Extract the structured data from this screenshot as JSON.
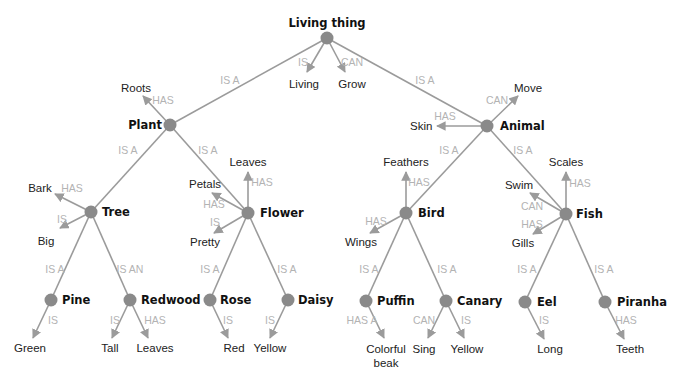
{
  "diagram": {
    "type": "semantic-network",
    "colors": {
      "edge": "#9b9b9b",
      "node": "#8a8a8a",
      "relation_text": "#b3b3b3",
      "node_text": "#111111",
      "leaf_text": "#222222"
    },
    "nodes": [
      {
        "id": "living_thing",
        "label": "Living thing",
        "x": 327,
        "y": 38,
        "label_x": 327,
        "label_y": 27,
        "anchor": "middle"
      },
      {
        "id": "plant",
        "label": "Plant",
        "x": 170,
        "y": 125,
        "label_x": 162,
        "label_y": 129,
        "anchor": "end"
      },
      {
        "id": "animal",
        "label": "Animal",
        "x": 487,
        "y": 126,
        "label_x": 500,
        "label_y": 130,
        "anchor": "start"
      },
      {
        "id": "tree",
        "label": "Tree",
        "x": 91,
        "y": 212,
        "label_x": 102,
        "label_y": 216,
        "anchor": "start"
      },
      {
        "id": "flower",
        "label": "Flower",
        "x": 248,
        "y": 213,
        "label_x": 260,
        "label_y": 217,
        "anchor": "start"
      },
      {
        "id": "bird",
        "label": "Bird",
        "x": 406,
        "y": 213,
        "label_x": 418,
        "label_y": 217,
        "anchor": "start"
      },
      {
        "id": "fish",
        "label": "Fish",
        "x": 566,
        "y": 214,
        "label_x": 576,
        "label_y": 218,
        "anchor": "start"
      },
      {
        "id": "pine",
        "label": "Pine",
        "x": 51,
        "y": 300,
        "label_x": 62,
        "label_y": 304,
        "anchor": "start"
      },
      {
        "id": "redwood",
        "label": "Redwood",
        "x": 130,
        "y": 300,
        "label_x": 141,
        "label_y": 304,
        "anchor": "start"
      },
      {
        "id": "rose",
        "label": "Rose",
        "x": 210,
        "y": 300,
        "label_x": 220,
        "label_y": 304,
        "anchor": "start"
      },
      {
        "id": "daisy",
        "label": "Daisy",
        "x": 288,
        "y": 300,
        "label_x": 298,
        "label_y": 304,
        "anchor": "start"
      },
      {
        "id": "puffin",
        "label": "Puffin",
        "x": 366,
        "y": 301,
        "label_x": 377,
        "label_y": 305,
        "anchor": "start"
      },
      {
        "id": "canary",
        "label": "Canary",
        "x": 446,
        "y": 301,
        "label_x": 457,
        "label_y": 305,
        "anchor": "start"
      },
      {
        "id": "eel",
        "label": "Eel",
        "x": 525,
        "y": 302,
        "label_x": 537,
        "label_y": 306,
        "anchor": "start"
      },
      {
        "id": "piranha",
        "label": "Piranha",
        "x": 605,
        "y": 302,
        "label_x": 617,
        "label_y": 306,
        "anchor": "start"
      }
    ],
    "edges": [
      {
        "from": "living_thing",
        "to": "plant",
        "relation": "IS A",
        "x1": 327,
        "y1": 38,
        "x2": 170,
        "y2": 125,
        "arrow": false,
        "rel_x": 230,
        "rel_y": 84
      },
      {
        "from": "living_thing",
        "to": "animal",
        "relation": "IS A",
        "x1": 327,
        "y1": 38,
        "x2": 487,
        "y2": 126,
        "arrow": false,
        "rel_x": 425,
        "rel_y": 84
      },
      {
        "from": "plant",
        "to": "tree",
        "relation": "IS A",
        "x1": 170,
        "y1": 125,
        "x2": 91,
        "y2": 212,
        "arrow": false,
        "rel_x": 128,
        "rel_y": 154
      },
      {
        "from": "plant",
        "to": "flower",
        "relation": "IS A",
        "x1": 170,
        "y1": 125,
        "x2": 248,
        "y2": 213,
        "arrow": false,
        "rel_x": 208,
        "rel_y": 154
      },
      {
        "from": "animal",
        "to": "bird",
        "relation": "IS A",
        "x1": 487,
        "y1": 126,
        "x2": 406,
        "y2": 213,
        "arrow": false,
        "rel_x": 449,
        "rel_y": 154
      },
      {
        "from": "animal",
        "to": "fish",
        "relation": "IS A",
        "x1": 487,
        "y1": 126,
        "x2": 566,
        "y2": 214,
        "arrow": false,
        "rel_x": 523,
        "rel_y": 154
      },
      {
        "from": "tree",
        "to": "pine",
        "relation": "IS A",
        "x1": 91,
        "y1": 212,
        "x2": 51,
        "y2": 300,
        "arrow": false,
        "rel_x": 55,
        "rel_y": 273
      },
      {
        "from": "tree",
        "to": "redwood",
        "relation": "IS AN",
        "x1": 91,
        "y1": 212,
        "x2": 130,
        "y2": 300,
        "arrow": false,
        "rel_x": 130,
        "rel_y": 273
      },
      {
        "from": "flower",
        "to": "rose",
        "relation": "IS A",
        "x1": 248,
        "y1": 213,
        "x2": 210,
        "y2": 300,
        "arrow": false,
        "rel_x": 210,
        "rel_y": 273
      },
      {
        "from": "flower",
        "to": "daisy",
        "relation": "IS A",
        "x1": 248,
        "y1": 213,
        "x2": 288,
        "y2": 300,
        "arrow": false,
        "rel_x": 287,
        "rel_y": 273
      },
      {
        "from": "bird",
        "to": "puffin",
        "relation": "IS A",
        "x1": 406,
        "y1": 213,
        "x2": 366,
        "y2": 301,
        "arrow": false,
        "rel_x": 369,
        "rel_y": 273
      },
      {
        "from": "bird",
        "to": "canary",
        "relation": "IS A",
        "x1": 406,
        "y1": 213,
        "x2": 446,
        "y2": 301,
        "arrow": false,
        "rel_x": 447,
        "rel_y": 273
      },
      {
        "from": "fish",
        "to": "eel",
        "relation": "IS A",
        "x1": 566,
        "y1": 214,
        "x2": 525,
        "y2": 302,
        "arrow": false,
        "rel_x": 527,
        "rel_y": 273
      },
      {
        "from": "fish",
        "to": "piranha",
        "relation": "IS A",
        "x1": 566,
        "y1": 214,
        "x2": 605,
        "y2": 302,
        "arrow": false,
        "rel_x": 604,
        "rel_y": 273
      },
      {
        "from": "living_thing",
        "to": "living",
        "relation": "IS",
        "x1": 327,
        "y1": 38,
        "x2": 307,
        "y2": 72,
        "arrow": true,
        "rel_x": 303,
        "rel_y": 66
      },
      {
        "from": "living_thing",
        "to": "grow",
        "relation": "CAN",
        "x1": 327,
        "y1": 38,
        "x2": 345,
        "y2": 72,
        "arrow": true,
        "rel_x": 352,
        "rel_y": 66
      },
      {
        "from": "plant",
        "to": "roots",
        "relation": "HAS",
        "x1": 170,
        "y1": 125,
        "x2": 143,
        "y2": 96,
        "arrow": true,
        "rel_x": 163,
        "rel_y": 104
      },
      {
        "from": "animal",
        "to": "move",
        "relation": "CAN",
        "x1": 487,
        "y1": 126,
        "x2": 518,
        "y2": 96,
        "arrow": true,
        "rel_x": 497,
        "rel_y": 104
      },
      {
        "from": "animal",
        "to": "skin",
        "relation": "HAS",
        "x1": 487,
        "y1": 126,
        "x2": 437,
        "y2": 126,
        "arrow": true,
        "rel_x": 445,
        "rel_y": 120
      },
      {
        "from": "tree",
        "to": "bark",
        "relation": "HAS",
        "x1": 91,
        "y1": 212,
        "x2": 55,
        "y2": 194,
        "arrow": true,
        "rel_x": 72,
        "rel_y": 192
      },
      {
        "from": "tree",
        "to": "big",
        "relation": "IS",
        "x1": 91,
        "y1": 212,
        "x2": 60,
        "y2": 228,
        "arrow": true,
        "rel_x": 62,
        "rel_y": 223
      },
      {
        "from": "flower",
        "to": "leaves",
        "relation": "HAS",
        "x1": 248,
        "y1": 213,
        "x2": 248,
        "y2": 172,
        "arrow": true,
        "rel_x": 262,
        "rel_y": 186
      },
      {
        "from": "flower",
        "to": "petals",
        "relation": "HAS",
        "x1": 248,
        "y1": 213,
        "x2": 212,
        "y2": 193,
        "arrow": true,
        "rel_x": 214,
        "rel_y": 208
      },
      {
        "from": "flower",
        "to": "pretty",
        "relation": "IS",
        "x1": 248,
        "y1": 213,
        "x2": 214,
        "y2": 233,
        "arrow": true,
        "rel_x": 215,
        "rel_y": 226
      },
      {
        "from": "bird",
        "to": "feathers",
        "relation": "HAS",
        "x1": 406,
        "y1": 213,
        "x2": 406,
        "y2": 172,
        "arrow": true,
        "rel_x": 419,
        "rel_y": 186
      },
      {
        "from": "bird",
        "to": "wings",
        "relation": "HAS",
        "x1": 406,
        "y1": 213,
        "x2": 370,
        "y2": 233,
        "arrow": true,
        "rel_x": 376,
        "rel_y": 225
      },
      {
        "from": "fish",
        "to": "scales",
        "relation": "HAS",
        "x1": 566,
        "y1": 214,
        "x2": 566,
        "y2": 172,
        "arrow": true,
        "rel_x": 580,
        "rel_y": 187
      },
      {
        "from": "fish",
        "to": "swim",
        "relation": "CAN",
        "x1": 566,
        "y1": 214,
        "x2": 530,
        "y2": 193,
        "arrow": true,
        "rel_x": 532,
        "rel_y": 210
      },
      {
        "from": "fish",
        "to": "gills",
        "relation": "HAS",
        "x1": 566,
        "y1": 214,
        "x2": 533,
        "y2": 234,
        "arrow": true,
        "rel_x": 532,
        "rel_y": 228
      },
      {
        "from": "pine",
        "to": "green",
        "relation": "IS",
        "x1": 51,
        "y1": 300,
        "x2": 33,
        "y2": 338,
        "arrow": true,
        "rel_x": 53,
        "rel_y": 324
      },
      {
        "from": "redwood",
        "to": "tall",
        "relation": "IS",
        "x1": 130,
        "y1": 300,
        "x2": 112,
        "y2": 338,
        "arrow": true,
        "rel_x": 115,
        "rel_y": 324
      },
      {
        "from": "redwood",
        "to": "leaves2",
        "relation": "HAS",
        "x1": 130,
        "y1": 300,
        "x2": 148,
        "y2": 338,
        "arrow": true,
        "rel_x": 155,
        "rel_y": 324
      },
      {
        "from": "rose",
        "to": "red",
        "relation": "IS",
        "x1": 210,
        "y1": 300,
        "x2": 228,
        "y2": 338,
        "arrow": true,
        "rel_x": 228,
        "rel_y": 324
      },
      {
        "from": "daisy",
        "to": "yellow",
        "relation": "IS",
        "x1": 288,
        "y1": 300,
        "x2": 270,
        "y2": 338,
        "arrow": true,
        "rel_x": 270,
        "rel_y": 324
      },
      {
        "from": "puffin",
        "to": "colorful_beak",
        "relation": "HAS A",
        "x1": 366,
        "y1": 301,
        "x2": 384,
        "y2": 338,
        "arrow": true,
        "rel_x": 362,
        "rel_y": 324
      },
      {
        "from": "canary",
        "to": "sing",
        "relation": "CAN",
        "x1": 446,
        "y1": 301,
        "x2": 428,
        "y2": 338,
        "arrow": true,
        "rel_x": 424,
        "rel_y": 324
      },
      {
        "from": "canary",
        "to": "yellow2",
        "relation": "IS",
        "x1": 446,
        "y1": 301,
        "x2": 464,
        "y2": 338,
        "arrow": true,
        "rel_x": 466,
        "rel_y": 324
      },
      {
        "from": "eel",
        "to": "long",
        "relation": "IS",
        "x1": 525,
        "y1": 302,
        "x2": 544,
        "y2": 339,
        "arrow": true,
        "rel_x": 544,
        "rel_y": 324
      },
      {
        "from": "piranha",
        "to": "teeth",
        "relation": "HAS",
        "x1": 605,
        "y1": 302,
        "x2": 624,
        "y2": 339,
        "arrow": true,
        "rel_x": 626,
        "rel_y": 324
      }
    ],
    "leaves": [
      {
        "id": "living",
        "label": "Living",
        "x": 304,
        "y": 88,
        "anchor": "middle"
      },
      {
        "id": "grow",
        "label": "Grow",
        "x": 352,
        "y": 88,
        "anchor": "middle"
      },
      {
        "id": "roots",
        "label": "Roots",
        "x": 136,
        "y": 92,
        "anchor": "middle"
      },
      {
        "id": "move",
        "label": "Move",
        "x": 528,
        "y": 92,
        "anchor": "middle"
      },
      {
        "id": "skin",
        "label": "Skin",
        "x": 410,
        "y": 130,
        "anchor": "start"
      },
      {
        "id": "bark",
        "label": "Bark",
        "x": 40,
        "y": 192,
        "anchor": "middle"
      },
      {
        "id": "big",
        "label": "Big",
        "x": 46,
        "y": 245,
        "anchor": "middle"
      },
      {
        "id": "leaves",
        "label": "Leaves",
        "x": 248,
        "y": 166,
        "anchor": "middle"
      },
      {
        "id": "petals",
        "label": "Petals",
        "x": 205,
        "y": 188,
        "anchor": "middle"
      },
      {
        "id": "pretty",
        "label": "Pretty",
        "x": 205,
        "y": 246,
        "anchor": "middle"
      },
      {
        "id": "feathers",
        "label": "Feathers",
        "x": 406,
        "y": 166,
        "anchor": "middle"
      },
      {
        "id": "wings",
        "label": "Wings",
        "x": 361,
        "y": 246,
        "anchor": "middle"
      },
      {
        "id": "scales",
        "label": "Scales",
        "x": 566,
        "y": 166,
        "anchor": "middle"
      },
      {
        "id": "swim",
        "label": "Swim",
        "x": 519,
        "y": 189,
        "anchor": "middle"
      },
      {
        "id": "gills",
        "label": "Gills",
        "x": 523,
        "y": 247,
        "anchor": "middle"
      },
      {
        "id": "green",
        "label": "Green",
        "x": 30,
        "y": 352,
        "anchor": "middle"
      },
      {
        "id": "tall",
        "label": "Tall",
        "x": 110,
        "y": 352,
        "anchor": "middle"
      },
      {
        "id": "leaves2",
        "label": "Leaves",
        "x": 155,
        "y": 352,
        "anchor": "middle"
      },
      {
        "id": "red",
        "label": "Red",
        "x": 234,
        "y": 352,
        "anchor": "middle"
      },
      {
        "id": "yellow",
        "label": "Yellow",
        "x": 270,
        "y": 352,
        "anchor": "middle"
      },
      {
        "id": "colorful_beak",
        "label": "Colorful",
        "label2": "beak",
        "x": 386,
        "y": 353,
        "y2": 367,
        "anchor": "middle"
      },
      {
        "id": "sing",
        "label": "Sing",
        "x": 424,
        "y": 353,
        "anchor": "middle"
      },
      {
        "id": "yellow2",
        "label": "Yellow",
        "x": 467,
        "y": 353,
        "anchor": "middle"
      },
      {
        "id": "long",
        "label": "Long",
        "x": 550,
        "y": 353,
        "anchor": "middle"
      },
      {
        "id": "teeth",
        "label": "Teeth",
        "x": 630,
        "y": 353,
        "anchor": "middle"
      }
    ]
  }
}
